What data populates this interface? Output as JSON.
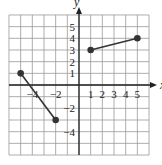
{
  "chart_data": {
    "type": "line",
    "title": "",
    "xlabel": "x",
    "ylabel": "y",
    "xlim": [
      -6,
      6
    ],
    "ylim": [
      -6,
      6
    ],
    "grid": true,
    "x_tick_labels": [
      "-4",
      "-2",
      "1",
      "2",
      "3",
      "4",
      "5"
    ],
    "y_tick_labels": [
      "5",
      "4",
      "3",
      "2",
      "1",
      "-2",
      "-4"
    ],
    "series": [
      {
        "name": "segment-1",
        "points": [
          [
            -5,
            1
          ],
          [
            -2,
            -3
          ]
        ],
        "endpoints": "closed"
      },
      {
        "name": "segment-2",
        "points": [
          [
            1,
            3
          ],
          [
            5,
            4
          ]
        ],
        "endpoints": "closed"
      }
    ],
    "colors": {
      "grid": "#999999",
      "axis": "#222222",
      "line": "#333333",
      "point": "#333333"
    }
  }
}
